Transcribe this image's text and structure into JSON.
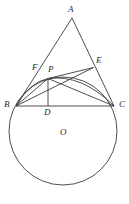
{
  "figure": {
    "background_color": "#ffffff",
    "stroke_color": "#3a3a3a",
    "label_color": "#2b2b2b",
    "stroke_width": 0.9,
    "watermark_text": "",
    "points": {
      "A": {
        "label": "A",
        "x": 72.0,
        "y": 18.0,
        "label_x": 68.0,
        "label_y": 5.0
      },
      "B": {
        "label": "B",
        "x": 16.0,
        "y": 106.0,
        "label_x": 4.0,
        "label_y": 100.0
      },
      "C": {
        "label": "C",
        "x": 114.0,
        "y": 106.0,
        "label_x": 119.0,
        "label_y": 100.0
      },
      "D": {
        "label": "D",
        "x": 48.0,
        "y": 106.0,
        "label_x": 44.0,
        "label_y": 108.0
      },
      "E": {
        "label": "E",
        "x": 93.5,
        "y": 67.5,
        "label_x": 96.0,
        "label_y": 56.0
      },
      "F": {
        "label": "F",
        "x": 42.0,
        "y": 72.0,
        "label_x": 32.0,
        "label_y": 63.0
      },
      "P": {
        "label": "P",
        "x": 48.0,
        "y": 78.5,
        "label_x": 48.5,
        "label_y": 65.0
      },
      "O": {
        "label": "O",
        "x": 63.0,
        "y": 137.0,
        "label_x": 60.0,
        "label_y": 128.0
      }
    },
    "circle": {
      "center_x": 63.0,
      "center_y": 131.0,
      "radius": 54.0
    },
    "segments": [
      {
        "name": "segment-AB",
        "from": "A",
        "to": "B"
      },
      {
        "name": "segment-AC",
        "from": "A",
        "to": "C"
      },
      {
        "name": "segment-BC",
        "from": "B",
        "to": "C"
      },
      {
        "name": "segment-BP",
        "from": "B",
        "to": "P"
      },
      {
        "name": "segment-BE",
        "from": "B",
        "to": "E"
      },
      {
        "name": "segment-PC",
        "from": "P",
        "to": "C"
      },
      {
        "name": "segment-PE",
        "from": "P",
        "to": "E"
      },
      {
        "name": "segment-PD",
        "from": "P",
        "to": "D"
      }
    ],
    "arcs": [
      {
        "name": "arc-BPC",
        "from": "B",
        "through": "P",
        "to": "C"
      }
    ]
  }
}
